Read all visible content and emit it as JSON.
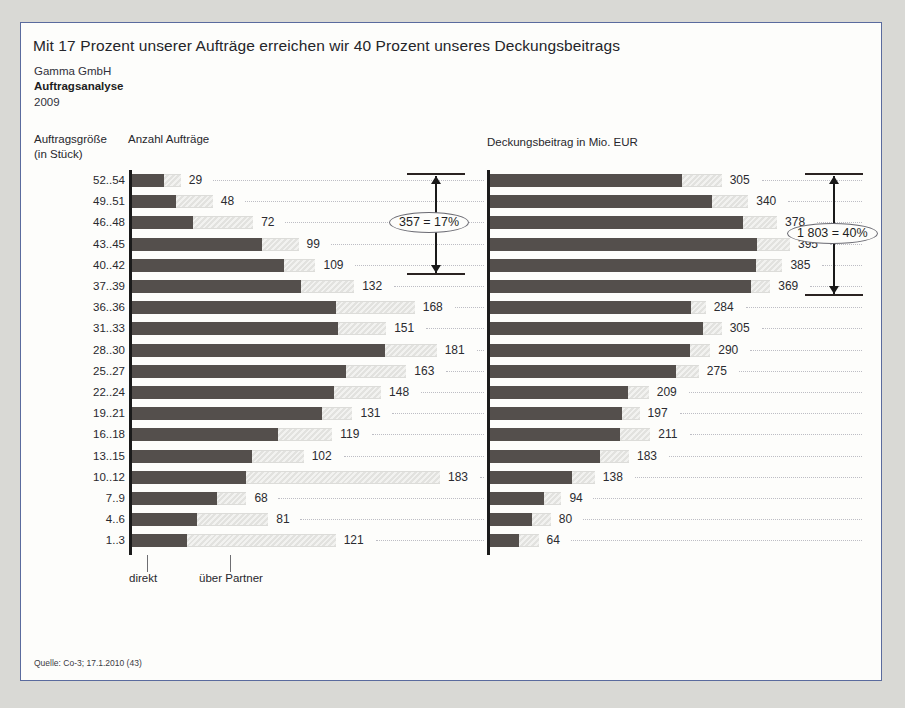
{
  "header": {
    "headline": "Mit 17 Prozent unserer Aufträge erreichen wir 40 Prozent unseres Deckungsbeitrags",
    "company": "Gamma GmbH",
    "subject": "Auftragsanalyse",
    "year": "2009"
  },
  "captions": {
    "category": "Auftragsgröße",
    "category_unit": "(in Stück)",
    "left_chart": "Anzahl Aufträge",
    "right_chart": "Deckungsbeitrag in Mio. EUR"
  },
  "legend": {
    "direct": "direkt",
    "partner": "über Partner"
  },
  "annotations": {
    "left_bracket": "357 = 17%",
    "right_bracket": "1 803 = 40%"
  },
  "source": "Quelle: Co-3; 17.1.2010 (43)",
  "chart_data": {
    "type": "bar",
    "title": "Mit 17 Prozent unserer Aufträge erreichen wir 40 Prozent unseres Deckungsbeitrags",
    "orientation": "horizontal",
    "categories": [
      "52..54",
      "49..51",
      "46..48",
      "43..45",
      "40..42",
      "37..39",
      "36..36",
      "31..33",
      "28..30",
      "25..27",
      "22..24",
      "19..21",
      "16..18",
      "13..15",
      "10..12",
      "7..9",
      "4..6",
      "1..3"
    ],
    "ylabel": "Auftragsgröße (in Stück)",
    "grid": false,
    "legend": [
      "direkt",
      "über Partner"
    ],
    "panels": [
      {
        "name": "Anzahl Aufträge",
        "xlabel": "Anzahl Aufträge",
        "xlim": [
          0,
          183
        ],
        "values": [
          29,
          48,
          72,
          99,
          109,
          132,
          168,
          151,
          181,
          163,
          148,
          131,
          119,
          102,
          183,
          68,
          81,
          121
        ],
        "direct_share": [
          0.65,
          0.55,
          0.5,
          0.78,
          0.83,
          0.76,
          0.72,
          0.81,
          0.83,
          0.78,
          0.81,
          0.86,
          0.73,
          0.7,
          0.37,
          0.74,
          0.48,
          0.27
        ],
        "bracket": {
          "label": "357 = 17%",
          "rows": [
            0,
            4
          ],
          "sum": 357,
          "percent": 17
        }
      },
      {
        "name": "Deckungsbeitrag in Mio. EUR",
        "xlabel": "Deckungsbeitrag in Mio. EUR",
        "xlim": [
          0,
          395
        ],
        "values": [
          305,
          340,
          378,
          395,
          385,
          369,
          284,
          305,
          290,
          275,
          209,
          197,
          211,
          183,
          138,
          94,
          80,
          64
        ],
        "direct_share": [
          0.83,
          0.86,
          0.88,
          0.89,
          0.91,
          0.93,
          0.93,
          0.92,
          0.91,
          0.89,
          0.87,
          0.88,
          0.81,
          0.79,
          0.78,
          0.75,
          0.69,
          0.6
        ],
        "bracket": {
          "label": "1 803 = 40%",
          "rows": [
            0,
            5
          ],
          "sum": 1803,
          "percent": 40
        }
      }
    ]
  },
  "colors": {
    "bar_direct": "#544f4c",
    "bar_partner": "#e6e6e4",
    "border": "#5a6b9e",
    "page_background": "#d9d9d5",
    "slide_background": "#fdfdfb"
  }
}
